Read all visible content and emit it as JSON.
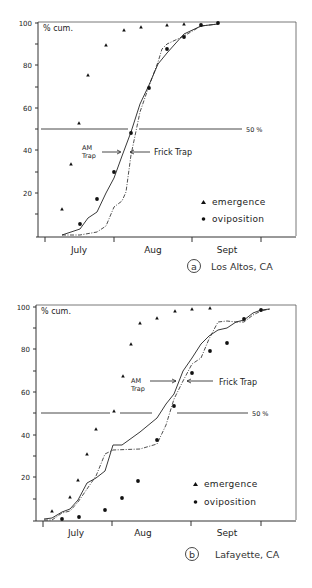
{
  "chart_data": [
    {
      "id": "a",
      "type": "scatter",
      "panel_label": "a",
      "location": "Los Altos, CA",
      "title": "",
      "ylabel": "% cum.",
      "xlabel": "",
      "ylim": [
        0,
        100
      ],
      "yticks": [
        20,
        40,
        60,
        80,
        100
      ],
      "xticks_months": [
        "July",
        "Aug",
        "Sept"
      ],
      "reference_line": {
        "value": 50,
        "label": "50 %"
      },
      "annotations": [
        {
          "text": "AM Trap",
          "points_to": "AM trap curve at 40%"
        },
        {
          "text": "Frick Trap",
          "points_to": "Frick trap curve at 40%"
        }
      ],
      "legend": [
        {
          "marker": "triangle",
          "label": "emergence"
        },
        {
          "marker": "circle",
          "label": "oviposition"
        }
      ],
      "series": [
        {
          "name": "emergence",
          "marker": "triangle",
          "points_px": [
            [
              62,
              209
            ],
            [
              71,
              164
            ],
            [
              79,
              123
            ],
            [
              88,
              75
            ],
            [
              106,
              45
            ],
            [
              124,
              30
            ],
            [
              141,
              27
            ],
            [
              167,
              25
            ],
            [
              184,
              24
            ]
          ],
          "values_pct": [
            12.5,
            33,
            53,
            76,
            90,
            97,
            98,
            99,
            99.5
          ]
        },
        {
          "name": "oviposition",
          "marker": "circle",
          "points_px": [
            [
              80,
              224
            ],
            [
              97,
              199
            ],
            [
              114,
              172
            ],
            [
              131,
              133
            ],
            [
              149,
              88
            ],
            [
              167,
              49
            ],
            [
              184,
              37
            ],
            [
              201,
              25
            ],
            [
              218,
              23
            ]
          ],
          "values_pct": [
            5.5,
            17,
            30,
            48,
            69,
            88,
            93,
            99,
            100
          ]
        },
        {
          "name": "AM Trap",
          "style": "solid line",
          "points_px": [
            [
              62,
              235
            ],
            [
              80,
              229
            ],
            [
              88,
              218
            ],
            [
              97,
              212
            ],
            [
              106,
              193
            ],
            [
              114,
              178
            ],
            [
              122,
              156
            ],
            [
              131,
              132
            ],
            [
              140,
              104
            ],
            [
              149,
              85
            ],
            [
              158,
              64
            ],
            [
              167,
              53
            ],
            [
              175,
              44
            ],
            [
              184,
              34
            ],
            [
              201,
              26
            ],
            [
              218,
              24
            ]
          ]
        },
        {
          "name": "Frick Trap",
          "style": "dash-dot line",
          "points_px": [
            [
              62,
              235
            ],
            [
              80,
              235
            ],
            [
              97,
              232
            ],
            [
              106,
              226
            ],
            [
              114,
              207
            ],
            [
              122,
              201
            ],
            [
              126,
              192
            ],
            [
              131,
              155
            ],
            [
              140,
              112
            ],
            [
              149,
              86
            ],
            [
              158,
              62
            ],
            [
              162,
              49
            ],
            [
              167,
              44
            ],
            [
              184,
              36
            ],
            [
              201,
              26
            ],
            [
              218,
              24
            ]
          ]
        }
      ]
    },
    {
      "id": "b",
      "type": "scatter",
      "panel_label": "b",
      "location": "Lafayette, CA",
      "title": "",
      "ylabel": "% cum.",
      "xlabel": "",
      "ylim": [
        0,
        100
      ],
      "yticks": [
        20,
        40,
        60,
        80,
        100
      ],
      "xticks_months": [
        "July",
        "Aug",
        "Sept"
      ],
      "reference_line": {
        "value": 50,
        "label": "50 %"
      },
      "annotations": [
        {
          "text": "AM Trap",
          "points_to": "AM trap curve at 65%"
        },
        {
          "text": "Frick Trap",
          "points_to": "Frick trap curve at 65%"
        }
      ],
      "legend": [
        {
          "marker": "triangle",
          "label": "emergence"
        },
        {
          "marker": "circle",
          "label": "oviposition"
        }
      ],
      "series": [
        {
          "name": "emergence",
          "marker": "triangle",
          "points_px": [
            [
              52,
              511
            ],
            [
              70,
              497
            ],
            [
              78,
              480
            ],
            [
              87,
              454
            ],
            [
              96,
              429
            ],
            [
              114,
              411
            ],
            [
              123,
              376
            ],
            [
              131,
              344
            ],
            [
              140,
              323
            ],
            [
              157,
              318
            ],
            [
              175,
              311
            ],
            [
              192,
              309
            ],
            [
              210,
              308
            ]
          ],
          "values_pct": [
            4,
            11,
            19,
            31,
            43,
            51,
            67,
            82.5,
            92.5,
            95,
            98,
            99,
            99.5
          ]
        },
        {
          "name": "oviposition",
          "marker": "circle",
          "points_px": [
            [
              62,
              519
            ],
            [
              79,
              517
            ],
            [
              105,
              510
            ],
            [
              122,
              498
            ],
            [
              138,
              481
            ],
            [
              157,
              440
            ],
            [
              174,
              406
            ],
            [
              192,
              373
            ],
            [
              210,
              351
            ],
            [
              227,
              343
            ],
            [
              244,
              319
            ],
            [
              261,
              310
            ]
          ],
          "values_pct": [
            0.5,
            1.5,
            4.5,
            10.5,
            18.5,
            37.5,
            53.5,
            69,
            79.5,
            83,
            94.5,
            98.5
          ]
        },
        {
          "name": "AM Trap",
          "style": "solid line",
          "points_px": [
            [
              44,
              519
            ],
            [
              52,
              518
            ],
            [
              62,
              512
            ],
            [
              70,
              509
            ],
            [
              78,
              500
            ],
            [
              87,
              483
            ],
            [
              96,
              478
            ],
            [
              105,
              471
            ],
            [
              113,
              445
            ],
            [
              122,
              445
            ],
            [
              140,
              432
            ],
            [
              157,
              418
            ],
            [
              166,
              404
            ],
            [
              174,
              394
            ],
            [
              183,
              371
            ],
            [
              192,
              358
            ],
            [
              201,
              344
            ],
            [
              209,
              336
            ],
            [
              218,
              330
            ],
            [
              227,
              328
            ],
            [
              236,
              322
            ],
            [
              244,
              320
            ],
            [
              253,
              313
            ],
            [
              261,
              310
            ],
            [
              270,
              309
            ]
          ],
          "values_pct_note": "piecewise cumulative curve"
        },
        {
          "name": "Frick Trap",
          "style": "dash-dot line",
          "points_px": [
            [
              44,
              520
            ],
            [
              52,
              520
            ],
            [
              62,
              513
            ],
            [
              70,
              511
            ],
            [
              78,
              502
            ],
            [
              87,
              489
            ],
            [
              96,
              476
            ],
            [
              105,
              454
            ],
            [
              113,
              450
            ],
            [
              140,
              449
            ],
            [
              157,
              444
            ],
            [
              166,
              425
            ],
            [
              174,
              399
            ],
            [
              183,
              381
            ],
            [
              192,
              364
            ],
            [
              201,
              358
            ],
            [
              209,
              339
            ],
            [
              218,
              322
            ],
            [
              227,
              321
            ],
            [
              236,
              322
            ],
            [
              244,
              322
            ],
            [
              253,
              315
            ],
            [
              261,
              311
            ],
            [
              270,
              309
            ]
          ]
        }
      ]
    }
  ],
  "panels": {
    "a": {
      "ylabel": "% cum.",
      "yticks": [
        "100",
        "80",
        "60",
        "40",
        "20"
      ],
      "months": [
        "July",
        "Aug",
        "Sept"
      ],
      "ref_label": "50 %",
      "am_trap_line1": "AM",
      "am_trap_line2": "Trap",
      "frick_trap": "Frick Trap",
      "legend_emergence": "emergence",
      "legend_oviposition": "oviposition",
      "panel_letter": "a",
      "location": "Los Altos, CA"
    },
    "b": {
      "ylabel": "% cum.",
      "yticks": [
        "100",
        "80",
        "60",
        "40",
        "20"
      ],
      "months": [
        "July",
        "Aug",
        "Sept"
      ],
      "ref_label": "50 %",
      "am_trap_line1": "AM",
      "am_trap_line2": "Trap",
      "frick_trap": "Frick Trap",
      "legend_emergence": "emergence",
      "legend_oviposition": "oviposition",
      "panel_letter": "b",
      "location": "Lafayette, CA"
    }
  }
}
